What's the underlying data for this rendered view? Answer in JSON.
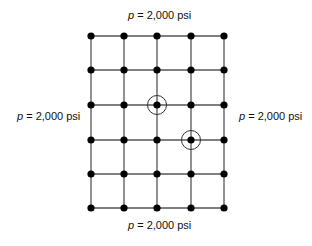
{
  "diagram": {
    "type": "grid-of-nodes",
    "columns": 5,
    "rows": 6,
    "col_x": [
      91,
      124,
      157,
      191,
      224
    ],
    "row_y": [
      36,
      70,
      105,
      140,
      174,
      208
    ],
    "circled_nodes": [
      {
        "col": 2,
        "row": 2
      },
      {
        "col": 3,
        "row": 3
      }
    ],
    "boundary_labels": {
      "top": {
        "var": "p",
        "text": " = 2,000 psi"
      },
      "bottom": {
        "var": "p",
        "text": " = 2,000 psi"
      },
      "left": {
        "var": "p",
        "text": " = 2,000 psi"
      },
      "right": {
        "var": "p",
        "text": " = 2,000 psi"
      }
    }
  }
}
